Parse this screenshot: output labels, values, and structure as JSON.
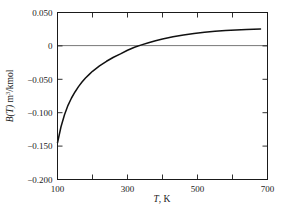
{
  "chart_data": {
    "type": "line",
    "title": "",
    "subtitle": "",
    "xlabel": "T, K",
    "xlabel_parts": {
      "symbol": "T",
      "unit": ", K"
    },
    "ylabel": "B(T) m3/kmol",
    "ylabel_parts": {
      "symbol": "B",
      "arg": "(T)",
      "unit": " m",
      "exp": "3",
      "unit2": "/kmol"
    },
    "xlim": [
      100,
      700
    ],
    "ylim": [
      -0.2,
      0.05
    ],
    "grid": false,
    "legend": null,
    "x_ticks": [
      100,
      200,
      300,
      400,
      500,
      600,
      700
    ],
    "x_tick_labels": [
      "100",
      "",
      "300",
      "",
      "500",
      "",
      "700"
    ],
    "y_ticks": [
      0.05,
      0,
      -0.05,
      -0.1,
      -0.15,
      -0.2
    ],
    "y_tick_labels": [
      "0.050",
      "0",
      "-0.050",
      "-0.100",
      "-0.150",
      "-0.200"
    ],
    "zero_line": 0,
    "series": [
      {
        "name": "B(T)",
        "color": "#111111",
        "x": [
          100,
          110,
          120,
          130,
          140,
          150,
          160,
          170,
          180,
          190,
          200,
          220,
          240,
          260,
          280,
          300,
          320,
          340,
          360,
          380,
          400,
          430,
          460,
          490,
          520,
          550,
          580,
          610,
          640,
          680
        ],
        "y": [
          -0.145,
          -0.121,
          -0.103,
          -0.089,
          -0.078,
          -0.069,
          -0.061,
          -0.054,
          -0.048,
          -0.043,
          -0.038,
          -0.03,
          -0.023,
          -0.017,
          -0.012,
          -0.0065,
          -0.002,
          0.0015,
          0.0048,
          0.0078,
          0.0103,
          0.0136,
          0.0163,
          0.0185,
          0.0203,
          0.0218,
          0.0229,
          0.0239,
          0.0246,
          0.0252
        ]
      }
    ],
    "annotations": [
      {
        "text": "zero crossing",
        "x": 290,
        "y": 0
      }
    ]
  },
  "axes": {
    "frame_color": "#1a1a1a",
    "background": "#ffffff"
  }
}
